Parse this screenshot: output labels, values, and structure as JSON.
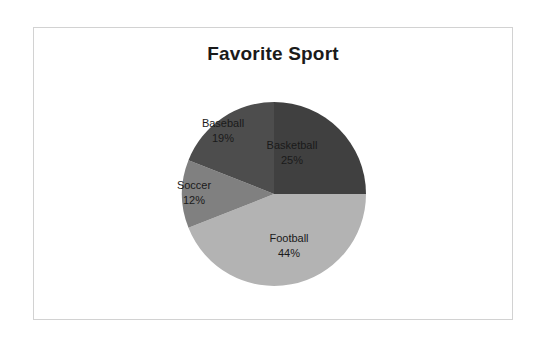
{
  "chart_data": {
    "type": "pie",
    "title": "Favorite Sport",
    "xlabel": "",
    "ylabel": "",
    "legend": false,
    "start_angle_deg": 0,
    "direction": "clockwise",
    "categories": [
      "Basketball",
      "Football",
      "Soccer",
      "Baseball"
    ],
    "values": [
      25,
      44,
      12,
      19
    ],
    "value_unit": "%",
    "labels": [
      "25%",
      "44%",
      "12%",
      "19%"
    ],
    "colors": [
      "#404040",
      "#b3b3b3",
      "#808080",
      "#4d4d4d"
    ],
    "slices": [
      {
        "name": "Basketball",
        "value": 25,
        "label": "25%",
        "color": "#404040"
      },
      {
        "name": "Football",
        "value": 44,
        "label": "44%",
        "color": "#b3b3b3"
      },
      {
        "name": "Soccer",
        "value": 12,
        "label": "12%",
        "color": "#808080"
      },
      {
        "name": "Baseball",
        "value": 19,
        "label": "19%",
        "color": "#4d4d4d"
      }
    ]
  },
  "frame": {
    "border_color": "#d2d2d2",
    "background": "#ffffff"
  }
}
